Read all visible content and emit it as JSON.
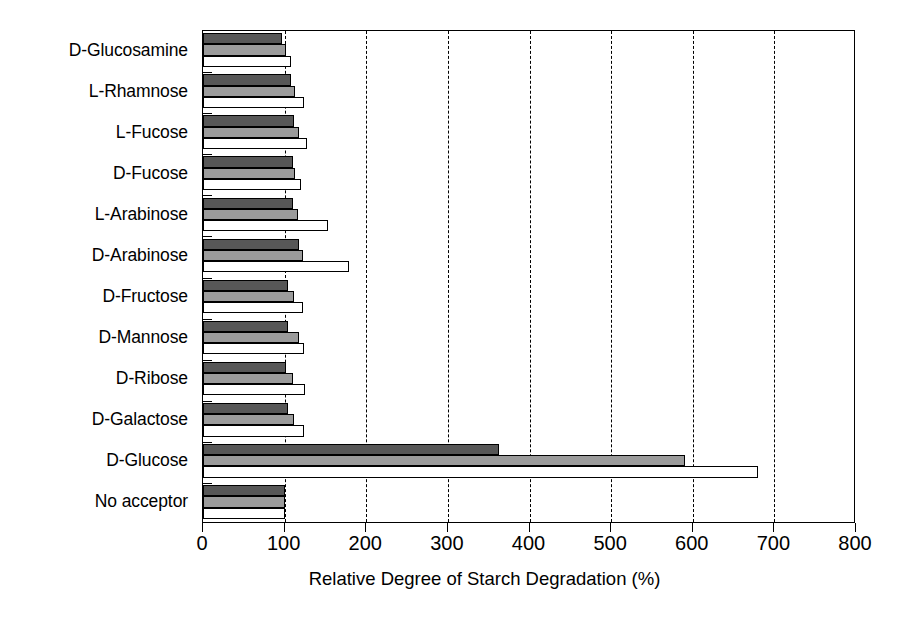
{
  "chart_data": {
    "type": "bar",
    "orientation": "horizontal",
    "title": "",
    "xlabel": "Relative Degree of Starch Degradation (%)",
    "ylabel": "",
    "xlim": [
      0,
      800
    ],
    "xticks": [
      0,
      100,
      200,
      300,
      400,
      500,
      600,
      700,
      800
    ],
    "xticklabels": [
      "0",
      "100",
      "200",
      "300",
      "400",
      "500",
      "600",
      "700",
      "800"
    ],
    "grid": "vertical-dashed",
    "legend": "none",
    "categories": [
      "D-Glucosamine",
      "L-Rhamnose",
      "L-Fucose",
      "D-Fucose",
      "L-Arabinose",
      "D-Arabinose",
      "D-Fructose",
      "D-Mannose",
      "D-Ribose",
      "D-Galactose",
      "D-Glucose",
      "No acceptor"
    ],
    "series": [
      {
        "name": "series-1",
        "color": "#575757",
        "values": [
          97,
          108,
          112,
          110,
          110,
          118,
          104,
          104,
          102,
          104,
          363,
          100
        ]
      },
      {
        "name": "series-2",
        "color": "#9b9b9b",
        "values": [
          102,
          113,
          118,
          113,
          116,
          122,
          112,
          118,
          110,
          112,
          590,
          100
        ]
      },
      {
        "name": "series-3",
        "color": "#ffffff",
        "values": [
          108,
          124,
          128,
          120,
          153,
          179,
          122,
          124,
          125,
          124,
          680,
          100
        ]
      }
    ]
  }
}
